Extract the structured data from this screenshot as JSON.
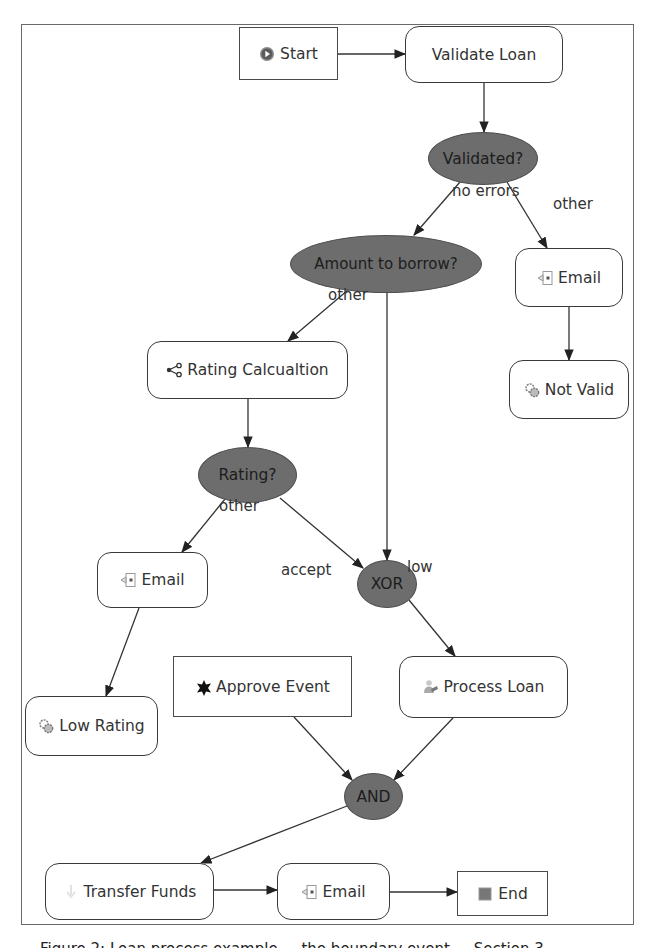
{
  "diagram": {
    "frame": {
      "x": 21,
      "y": 24,
      "w": 613,
      "h": 901
    },
    "colors": {
      "gateway_fill": "#6d6d6d",
      "node_border": "#3a3a3a",
      "edge": "#333333",
      "background": "#ffffff"
    },
    "nodes": [
      {
        "id": "start",
        "type": "event",
        "label": "Start",
        "icon": "play-circle-icon",
        "x": 239,
        "y": 27,
        "w": 99,
        "h": 53
      },
      {
        "id": "validate_loan",
        "type": "task",
        "label": "Validate Loan",
        "icon": "",
        "x": 405,
        "y": 26,
        "w": 158,
        "h": 57
      },
      {
        "id": "validated",
        "type": "gateway",
        "label": "Validated?",
        "x": 428,
        "y": 132,
        "w": 110,
        "h": 53
      },
      {
        "id": "amount",
        "type": "gateway",
        "label": "Amount to borrow?",
        "x": 290,
        "y": 235,
        "w": 192,
        "h": 58
      },
      {
        "id": "email_invalid",
        "type": "task",
        "label": "Email",
        "icon": "email-icon",
        "x": 515,
        "y": 248,
        "w": 108,
        "h": 59
      },
      {
        "id": "not_valid",
        "type": "task",
        "label": "Not Valid",
        "icon": "gears-icon",
        "x": 509,
        "y": 360,
        "w": 120,
        "h": 59
      },
      {
        "id": "rating_calc",
        "type": "task",
        "label": "Rating Calcualtion",
        "icon": "share-icon",
        "x": 147,
        "y": 341,
        "w": 201,
        "h": 58
      },
      {
        "id": "rating",
        "type": "gateway",
        "label": "Rating?",
        "x": 198,
        "y": 447,
        "w": 99,
        "h": 56
      },
      {
        "id": "email_low",
        "type": "task",
        "label": "Email",
        "icon": "email-icon",
        "x": 97,
        "y": 552,
        "w": 111,
        "h": 56
      },
      {
        "id": "xor",
        "type": "gateway",
        "label": "XOR",
        "x": 357,
        "y": 560,
        "w": 60,
        "h": 48
      },
      {
        "id": "low_rating",
        "type": "task",
        "label": "Low Rating",
        "icon": "gears-icon",
        "x": 25,
        "y": 696,
        "w": 133,
        "h": 60
      },
      {
        "id": "approve_event",
        "type": "event",
        "label": "Approve Event",
        "icon": "star-burst-icon",
        "x": 173,
        "y": 656,
        "w": 179,
        "h": 61
      },
      {
        "id": "process_loan",
        "type": "task",
        "label": "Process Loan",
        "icon": "user-task-icon",
        "x": 399,
        "y": 656,
        "w": 169,
        "h": 62
      },
      {
        "id": "and",
        "type": "gateway",
        "label": "AND",
        "x": 344,
        "y": 773,
        "w": 59,
        "h": 47
      },
      {
        "id": "transfer_funds",
        "type": "task",
        "label": "Transfer Funds",
        "icon": "transfer-icon",
        "x": 45,
        "y": 863,
        "w": 169,
        "h": 57
      },
      {
        "id": "email_final",
        "type": "task",
        "label": "Email",
        "icon": "email-icon",
        "x": 277,
        "y": 863,
        "w": 113,
        "h": 57
      },
      {
        "id": "end",
        "type": "event",
        "label": "End",
        "icon": "stop-square-icon",
        "x": 457,
        "y": 871,
        "w": 91,
        "h": 45
      }
    ],
    "edges": [
      {
        "from": "start",
        "to": "validate_loan",
        "points": [
          [
            338,
            54
          ],
          [
            405,
            54
          ]
        ]
      },
      {
        "from": "validate_loan",
        "to": "validated",
        "points": [
          [
            484,
            83
          ],
          [
            484,
            132
          ]
        ]
      },
      {
        "from": "validated",
        "to": "amount",
        "label": "no errors",
        "points": [
          [
            460,
            182
          ],
          [
            414,
            235
          ]
        ]
      },
      {
        "from": "validated",
        "to": "email_invalid",
        "label": "other",
        "points": [
          [
            507,
            182
          ],
          [
            547,
            248
          ]
        ]
      },
      {
        "from": "email_invalid",
        "to": "not_valid",
        "points": [
          [
            569,
            307
          ],
          [
            569,
            360
          ]
        ]
      },
      {
        "from": "amount",
        "to": "rating_calc",
        "label": "other",
        "points": [
          [
            348,
            290
          ],
          [
            288,
            341
          ]
        ]
      },
      {
        "from": "amount",
        "to": "xor",
        "label": "low",
        "points": [
          [
            387,
            293
          ],
          [
            387,
            560
          ]
        ]
      },
      {
        "from": "rating_calc",
        "to": "rating",
        "points": [
          [
            248,
            399
          ],
          [
            248,
            447
          ]
        ]
      },
      {
        "from": "rating",
        "to": "email_low",
        "label": "other",
        "points": [
          [
            225,
            499
          ],
          [
            182,
            552
          ]
        ]
      },
      {
        "from": "rating",
        "to": "xor",
        "label": "accept",
        "points": [
          [
            280,
            498
          ],
          [
            363,
            568
          ]
        ]
      },
      {
        "from": "email_low",
        "to": "low_rating",
        "points": [
          [
            139,
            608
          ],
          [
            106,
            696
          ]
        ]
      },
      {
        "from": "xor",
        "to": "process_loan",
        "points": [
          [
            409,
            600
          ],
          [
            455,
            656
          ]
        ]
      },
      {
        "from": "approve_event",
        "to": "and",
        "points": [
          [
            294,
            717
          ],
          [
            352,
            780
          ]
        ]
      },
      {
        "from": "process_loan",
        "to": "and",
        "points": [
          [
            453,
            718
          ],
          [
            394,
            780
          ]
        ]
      },
      {
        "from": "and",
        "to": "transfer_funds",
        "points": [
          [
            347,
            806
          ],
          [
            201,
            863
          ]
        ]
      },
      {
        "from": "transfer_funds",
        "to": "email_final",
        "points": [
          [
            214,
            890
          ],
          [
            277,
            890
          ]
        ]
      },
      {
        "from": "email_final",
        "to": "end",
        "points": [
          [
            390,
            892
          ],
          [
            457,
            892
          ]
        ]
      }
    ],
    "edge_labels": [
      {
        "text": "no errors",
        "x": 452,
        "y": 190
      },
      {
        "text": "other",
        "x": 553,
        "y": 203
      },
      {
        "text": "other",
        "x": 328,
        "y": 294
      },
      {
        "text": "other",
        "x": 219,
        "y": 505
      },
      {
        "text": "low",
        "x": 407,
        "y": 566,
        "anchor_y": 566
      },
      {
        "text": "accept",
        "x": 281,
        "y": 569
      }
    ]
  },
  "caption": {
    "text": "Figure 2: Loan process example ... the boundary event ... Section 3 ..."
  }
}
